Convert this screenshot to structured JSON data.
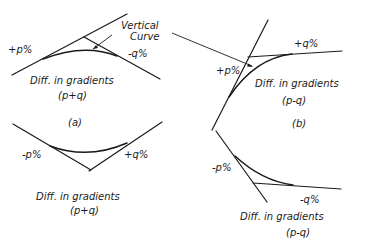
{
  "title_label": {
    "line1": "Vertical",
    "line2": "Curve"
  },
  "diagrams": {
    "a_top": {
      "grade_left": "+p%",
      "grade_right": "-q%",
      "caption_line1": "Diff. in gradients",
      "caption_line2": "(p+q)"
    },
    "a_bottom": {
      "tag": "(a)",
      "grade_left": "-p%",
      "grade_right": "+q%",
      "caption_line1": "Diff. in gradients",
      "caption_line2": "(p+q)"
    },
    "b_top": {
      "grade_left": "+p%",
      "grade_right": "+q%",
      "caption_line1": "Diff. in gradients",
      "caption_line2": "(p-q)",
      "tag": "(b)"
    },
    "b_bottom": {
      "grade_left": "-p%",
      "grade_right": "-q%",
      "caption_line1": "Diff. in gradients",
      "caption_line2": "(p-q)"
    }
  }
}
